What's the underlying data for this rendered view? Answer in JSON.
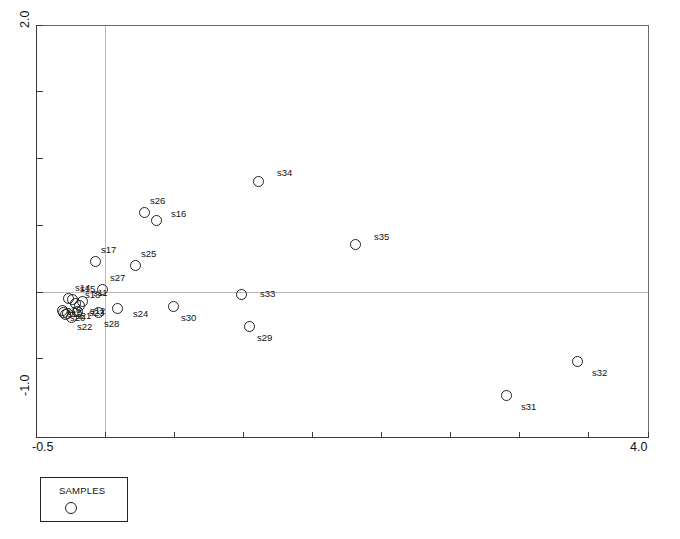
{
  "chart_data": {
    "type": "scatter",
    "title": "",
    "xlabel": "",
    "ylabel": "",
    "xlim": [
      -0.5,
      4.0
    ],
    "ylim": [
      -1.0,
      2.0
    ],
    "grid": true,
    "gridlines": {
      "vertical_at_x": 0.0,
      "horizontal_at_y": 0.0
    },
    "legend": {
      "position": "below-left",
      "title": "SAMPLES",
      "marker": "open-circle"
    },
    "x_ticks": [
      -0.5,
      4.0
    ],
    "x_tick_labels": [
      "-0.5",
      "4.0"
    ],
    "y_ticks": [
      2.0,
      -1.0
    ],
    "y_tick_labels": [
      "2.0",
      "-1.0"
    ],
    "series_name": "SAMPLES",
    "marker_style": "open-circle",
    "points": [
      {
        "label": "s14",
        "x": 0.03,
        "y": 0.06,
        "px": 63,
        "py": 293,
        "lx": 1,
        "ly": -10
      },
      {
        "label": "s15",
        "x": 0.06,
        "y": 0.05,
        "px": 67,
        "py": 294,
        "lx": 2,
        "ly": -10
      },
      {
        "label": "s18",
        "x": -0.03,
        "y": -0.02,
        "px": 57,
        "py": 305,
        "lx": -2,
        "ly": 0
      },
      {
        "label": "s19",
        "x": -0.02,
        "y": -0.03,
        "px": 58,
        "py": 307,
        "lx": -2,
        "ly": 2
      },
      {
        "label": "s20",
        "x": 0.0,
        "y": -0.05,
        "px": 60,
        "py": 309,
        "lx": -1,
        "ly": 4
      },
      {
        "label": "s21",
        "x": 0.02,
        "y": -0.04,
        "px": 62,
        "py": 308,
        "lx": 3,
        "ly": 3
      },
      {
        "label": "s23",
        "x": 0.1,
        "y": -0.03,
        "px": 72,
        "py": 306,
        "lx": 6,
        "ly": 2
      },
      {
        "label": "s22",
        "x": 0.05,
        "y": -0.1,
        "px": 66,
        "py": 312,
        "lx": 0,
        "ly": 10
      },
      {
        "label": "s13",
        "x": 0.08,
        "y": 0.02,
        "px": 70,
        "py": 298,
        "lx": 4,
        "ly": -8
      },
      {
        "label": "s12",
        "x": 0.12,
        "y": 0.0,
        "px": 74,
        "py": 300,
        "lx": 5,
        "ly": 6
      },
      {
        "label": "s11",
        "x": 0.14,
        "y": 0.04,
        "px": 77,
        "py": 296,
        "lx": 5,
        "ly": -8
      },
      {
        "label": "s27",
        "x": 0.33,
        "y": 0.2,
        "px": 97,
        "py": 284,
        "lx": 2,
        "ly": -11
      },
      {
        "label": "s28",
        "x": 0.3,
        "y": -0.06,
        "px": 93,
        "py": 307,
        "lx": 0,
        "ly": 12
      },
      {
        "label": "s17",
        "x": 0.14,
        "y": 0.38,
        "px": 90,
        "py": 256,
        "lx": 0,
        "ly": -11
      },
      {
        "label": "s25",
        "x": 0.55,
        "y": 0.33,
        "px": 130,
        "py": 260,
        "lx": 0,
        "ly": -11
      },
      {
        "label": "s26",
        "x": 0.72,
        "y": 0.73,
        "px": 139,
        "py": 207,
        "lx": 0,
        "ly": -11
      },
      {
        "label": "s16",
        "x": 0.85,
        "y": 0.65,
        "px": 151,
        "py": 215,
        "lx": 9,
        "ly": -6
      },
      {
        "label": "s24",
        "x": 0.6,
        "y": -0.03,
        "px": 112,
        "py": 303,
        "lx": 10,
        "ly": 6
      },
      {
        "label": "s30",
        "x": 1.05,
        "y": -0.1,
        "px": 168,
        "py": 301,
        "lx": 2,
        "ly": 12
      },
      {
        "label": "s33",
        "x": 1.58,
        "y": 0.0,
        "px": 236,
        "py": 289,
        "lx": 13,
        "ly": 0
      },
      {
        "label": "s29",
        "x": 1.65,
        "y": -0.23,
        "px": 244,
        "py": 321,
        "lx": 2,
        "ly": 12
      },
      {
        "label": "s34",
        "x": 1.72,
        "y": 0.97,
        "px": 253,
        "py": 176,
        "lx": 13,
        "ly": -8
      },
      {
        "label": "s35",
        "x": 2.4,
        "y": 0.52,
        "px": 350,
        "py": 239,
        "lx": 13,
        "ly": -7
      },
      {
        "label": "s31",
        "x": 3.4,
        "y": -0.88,
        "px": 501,
        "py": 390,
        "lx": 9,
        "ly": 12
      },
      {
        "label": "s32",
        "x": 3.85,
        "y": -0.63,
        "px": 572,
        "py": 356,
        "lx": 9,
        "ly": 12
      }
    ]
  },
  "axes": {
    "x_min_label": "-0.5",
    "x_max_label": "4.0",
    "y_min_label": "-1.0",
    "y_max_label": "2.0"
  },
  "legend": {
    "title": "SAMPLES"
  },
  "colors": {
    "axis": "#3a3a3a",
    "frame": "#6a6a6a",
    "grid": "#b9b9b9",
    "marker_stroke": "#222222",
    "text": "#111111",
    "background": "#ffffff"
  }
}
